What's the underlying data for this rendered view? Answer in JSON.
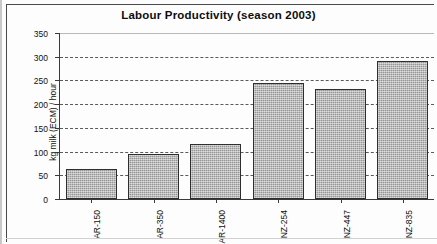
{
  "chart_data": {
    "type": "bar",
    "title": "Labour Productivity (season 2003)",
    "xlabel": "",
    "ylabel": "kg milk (ECM) / hour",
    "categories": [
      "AR-150",
      "AR-350",
      "AR-1400",
      "NZ-254",
      "NZ-447",
      "NZ-835"
    ],
    "values": [
      63,
      95,
      115,
      245,
      232,
      292
    ],
    "ylim": [
      0,
      350
    ],
    "yticks": [
      0,
      50,
      100,
      150,
      200,
      250,
      300,
      350
    ],
    "ytick_labels": [
      "0",
      "50",
      "100",
      "150",
      "200",
      "250",
      "300",
      "350"
    ],
    "grid": true,
    "grid_axis": "y",
    "legend": false,
    "series": [
      {
        "name": "kg milk (ECM) / hour",
        "values": [
          63,
          95,
          115,
          245,
          232,
          292
        ],
        "color": "#a9a9a9"
      }
    ]
  },
  "style": {
    "bar_fill": "#a9a9a9",
    "bar_edge": "#2e2e2e",
    "axis_color": "#3a3a3a",
    "grid_color": "#5a5a5a",
    "text_color": "#111111",
    "background": "#ffffff"
  }
}
